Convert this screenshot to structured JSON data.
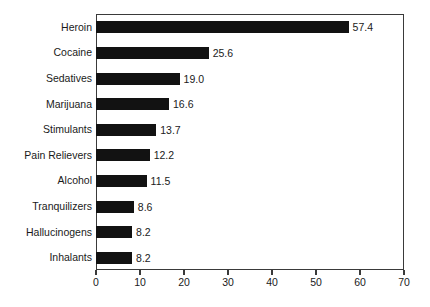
{
  "chart_data": {
    "type": "bar",
    "orientation": "horizontal",
    "title": "",
    "subtitle": "",
    "xlabel": "",
    "ylabel": "",
    "xlim": [
      0,
      70
    ],
    "xticks": [
      0,
      10,
      20,
      30,
      40,
      50,
      60,
      70
    ],
    "xtick_labels": [
      "0",
      "10",
      "20",
      "30",
      "40",
      "50",
      "60",
      "70"
    ],
    "grid": false,
    "legend": false,
    "legend_position": "none",
    "bar_color": "#121212",
    "frame_color": "#3a3a3a",
    "text_color": "#1a1a1a",
    "background": "#ffffff",
    "categories": [
      "Heroin",
      "Cocaine",
      "Sedatives",
      "Marijuana",
      "Stimulants",
      "Pain Relievers",
      "Alcohol",
      "Tranquilizers",
      "Hallucinogens",
      "Inhalants"
    ],
    "values": [
      57.4,
      25.6,
      19.0,
      16.6,
      13.7,
      12.2,
      11.5,
      8.6,
      8.2,
      8.2
    ],
    "value_labels": [
      "57.4",
      "25.6",
      "19.0",
      "16.6",
      "13.7",
      "12.2",
      "11.5",
      "8.6",
      "8.2",
      "8.2"
    ]
  }
}
